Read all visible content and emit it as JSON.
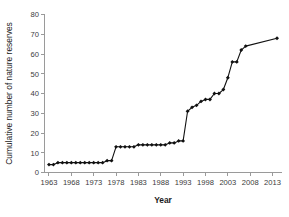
{
  "chart_data": {
    "type": "line",
    "title": "",
    "xlabel": "Year",
    "ylabel": "Cumulative number of nature reserves",
    "xlim": [
      1962,
      2015
    ],
    "ylim": [
      0,
      80
    ],
    "grid": false,
    "legend": false,
    "marker": "diamond",
    "line_color": "#111111",
    "marker_color": "#111111",
    "axis_color": "#9a9a9a",
    "xticks": [
      1963,
      1968,
      1973,
      1978,
      1983,
      1988,
      1993,
      1998,
      2003,
      2008,
      2013
    ],
    "xtick_labels": [
      "1963",
      "1968",
      "1973",
      "1978",
      "1983",
      "1988",
      "1993",
      "1998",
      "2003",
      "2008",
      "2013"
    ],
    "yticks": [
      0,
      10,
      20,
      30,
      40,
      50,
      60,
      70,
      80
    ],
    "ytick_labels": [
      "0",
      "10",
      "20",
      "30",
      "40",
      "50",
      "60",
      "70",
      "80"
    ],
    "x": [
      1963,
      1964,
      1965,
      1966,
      1967,
      1968,
      1969,
      1970,
      1971,
      1972,
      1973,
      1974,
      1975,
      1976,
      1977,
      1978,
      1979,
      1980,
      1981,
      1982,
      1983,
      1984,
      1985,
      1986,
      1987,
      1988,
      1989,
      1990,
      1991,
      1992,
      1993,
      1994,
      1995,
      1996,
      1997,
      1998,
      1999,
      2000,
      2001,
      2002,
      2003,
      2004,
      2005,
      2006,
      2007,
      2014
    ],
    "values": [
      4,
      4,
      5,
      5,
      5,
      5,
      5,
      5,
      5,
      5,
      5,
      5,
      5,
      6,
      6,
      13,
      13,
      13,
      13,
      13,
      14,
      14,
      14,
      14,
      14,
      14,
      14,
      15,
      15,
      16,
      16,
      31,
      33,
      34,
      36,
      37,
      37,
      40,
      40,
      42,
      48,
      56,
      56,
      62,
      64,
      68
    ]
  }
}
